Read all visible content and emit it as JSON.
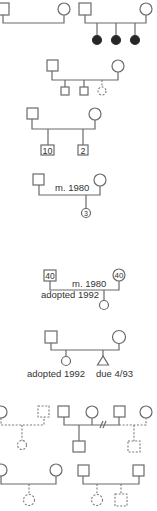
{
  "diagram": {
    "type": "pedigree-symbols",
    "groups": [
      {
        "id": "couple-no-children",
        "members": [
          "male",
          "female"
        ]
      },
      {
        "id": "affected-children",
        "members": [
          "male",
          "female"
        ],
        "children": [
          "affected-female",
          "affected-female",
          "affected-female"
        ]
      },
      {
        "id": "stillbirth-offspring",
        "members": [
          "male",
          "female"
        ],
        "children": [
          "male",
          "male",
          "unknown-dashed-female"
        ]
      },
      {
        "id": "multiple-offspring",
        "members": [
          "male",
          "female"
        ],
        "children": [
          {
            "sex": "male",
            "count": "10"
          },
          {
            "sex": "male",
            "count": "2"
          }
        ]
      },
      {
        "id": "married-couple",
        "members": [
          "male",
          "female"
        ],
        "marriage_label": "m. 1980",
        "children": [
          {
            "sex": "female",
            "count": "3"
          }
        ]
      },
      {
        "id": "adopted-child-couple",
        "members": [
          {
            "sex": "male",
            "age": "40"
          },
          {
            "sex": "female",
            "age": "40"
          }
        ],
        "marriage_label": "m. 1980",
        "child_label": "adopted 1992"
      },
      {
        "id": "pregnancy",
        "members": [
          "male",
          "female"
        ],
        "children": [
          {
            "sex": "female",
            "label": "adopted 1992"
          },
          {
            "sex": "pregnancy",
            "label": "due 4/93"
          }
        ]
      },
      {
        "id": "divorce-remarriage",
        "members": [
          "female",
          "dashed-male",
          "male",
          "female",
          "male",
          "female"
        ]
      },
      {
        "id": "donor-offspring",
        "members": [
          "female",
          "female",
          "male",
          "male"
        ]
      }
    ]
  },
  "labels": {
    "married_1": "m. 1980",
    "married_2": "m. 1980",
    "adopted_1": "adopted 1992",
    "adopted_2": "adopted 1992",
    "due": "due 4/93",
    "count_10": "10",
    "count_2": "2",
    "count_3": "3",
    "age_male": "40",
    "age_female": "40"
  }
}
